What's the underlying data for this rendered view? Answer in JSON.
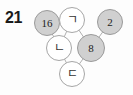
{
  "problem": {
    "number": "21"
  },
  "colors": {
    "page_background": "#fdfdfd",
    "filled_node_fill": "#d0d0d0",
    "filled_node_stroke": "#9a9a9a",
    "open_node_fill": "#ffffff",
    "open_node_stroke": "#a6a6a6",
    "edge_stroke": "#b0b0b0",
    "text": "#222222"
  },
  "diagram": {
    "type": "node-link-pyramid",
    "rows": [
      {
        "row_index": 0,
        "nodes": [
          {
            "id": "t1",
            "label": "16",
            "style": "filled",
            "label_kind": "number",
            "cx": 47,
            "cy": 23,
            "r": 13
          },
          {
            "id": "t2",
            "label": "ㄱ",
            "style": "open",
            "label_kind": "symbol",
            "cx": 72,
            "cy": 20,
            "r": 13
          },
          {
            "id": "t3",
            "label": "2",
            "style": "filled",
            "label_kind": "number",
            "cx": 110,
            "cy": 22,
            "r": 13
          }
        ]
      },
      {
        "row_index": 1,
        "nodes": [
          {
            "id": "m1",
            "label": "ㄴ",
            "style": "open",
            "label_kind": "symbol",
            "cx": 59,
            "cy": 48,
            "r": 13
          },
          {
            "id": "m2",
            "label": "8",
            "style": "filled",
            "label_kind": "number",
            "cx": 91,
            "cy": 48,
            "r": 14
          }
        ]
      },
      {
        "row_index": 2,
        "nodes": [
          {
            "id": "b1",
            "label": "ㄷ",
            "style": "open",
            "label_kind": "symbol",
            "cx": 72,
            "cy": 74,
            "r": 13
          }
        ]
      }
    ],
    "edges": [
      {
        "from": "t1",
        "to": "m1"
      },
      {
        "from": "t2",
        "to": "m1"
      },
      {
        "from": "t2",
        "to": "m2"
      },
      {
        "from": "t3",
        "to": "m2"
      },
      {
        "from": "m1",
        "to": "b1"
      },
      {
        "from": "m2",
        "to": "b1"
      }
    ]
  }
}
